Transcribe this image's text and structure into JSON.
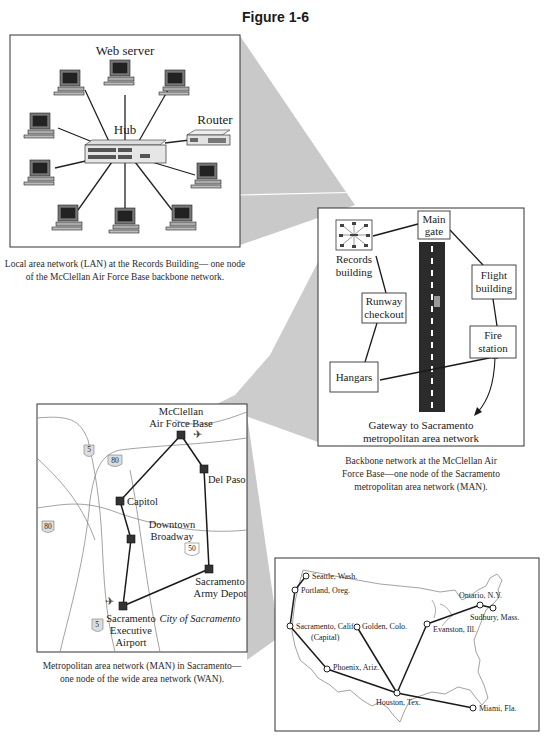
{
  "figure": {
    "title": "Figure 1-6"
  },
  "lan": {
    "labels": {
      "web_server": "Web server",
      "hub": "Hub",
      "router": "Router"
    },
    "caption_line1": "Local area network (LAN) at the Records Building— one node",
    "caption_line2": "of the McClellan Air Force Base backbone network."
  },
  "backbone": {
    "nodes": {
      "main_gate_1": "Main",
      "main_gate_2": "gate",
      "records_1": "Records",
      "records_2": "building",
      "flight_1": "Flight",
      "flight_2": "building",
      "runway_1": "Runway",
      "runway_2": "checkout",
      "fire_1": "Fire",
      "fire_2": "station",
      "hangars": "Hangars"
    },
    "gateway_1": "Gateway to Sacramento",
    "gateway_2": "metropolitan area network",
    "caption_line1": "Backbone network at the McClellan Air",
    "caption_line2": "Force Base—one node of the Sacramento",
    "caption_line3": "metropolitan area network (MAN)."
  },
  "man": {
    "nodes": {
      "mcclellan_1": "McClellan",
      "mcclellan_2": "Air Force Base",
      "del_paso": "Del Paso",
      "capitol": "Capitol",
      "downtown_1": "Downtown",
      "downtown_2": "Broadway",
      "depot_1": "Sacramento",
      "depot_2": "Army Depot",
      "airport_1": "Sacramento",
      "airport_2": "Executive",
      "airport_3": "Airport"
    },
    "city_label": "City of Sacramento",
    "highways": {
      "i5_top": "5",
      "i80_a": "80",
      "i80_b": "80",
      "us50": "50",
      "i5_bottom": "5"
    },
    "caption_line1": "Metropolitan area network (MAN) in Sacramento—",
    "caption_line2": "one node of the wide area network (WAN)."
  },
  "wan": {
    "cities": {
      "seattle": "Seattle, Wash.",
      "portland": "Portland, Oreg.",
      "sacramento_1": "Sacramento, Calif.",
      "sacramento_2": "(Capital)",
      "golden": "Golden, Colo.",
      "phoenix": "Phoenix, Ariz.",
      "houston": "Houston, Tex.",
      "evanston": "Evanston, Ill.",
      "ontario": "Ontario, N.Y.",
      "sudbury": "Sudbury, Mass.",
      "miami": "Miami, Fla."
    }
  },
  "colors": {
    "funnel": "#c8c8c8",
    "line": "#1a1a1a",
    "runway": "#2b2b2b",
    "map_line": "#8a8a8a"
  }
}
